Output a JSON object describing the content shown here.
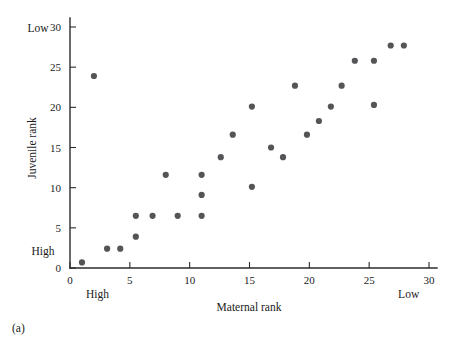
{
  "figure": {
    "caption": "(a)"
  },
  "chart_data": {
    "type": "scatter",
    "title": "",
    "xlabel": "Maternal rank",
    "ylabel": "Juvenile rank",
    "xlim": [
      0,
      31
    ],
    "ylim": [
      0,
      31
    ],
    "xticks": [
      0,
      5,
      10,
      15,
      20,
      25,
      30
    ],
    "xtick_labels": [
      "0",
      "5",
      "10",
      "15",
      "20",
      "25",
      "30"
    ],
    "yticks": [
      0,
      5,
      10,
      15,
      20,
      25,
      30
    ],
    "ytick_labels": [
      "0",
      "5",
      "10",
      "15",
      "20",
      "25",
      "30"
    ],
    "grid": false,
    "legend": null,
    "axis_end_labels": {
      "x_low_end": "High",
      "x_high_end": "Low",
      "y_low_end": "High",
      "y_high_end": "Low"
    },
    "marker": {
      "shape": "circle",
      "color": "#555558",
      "size": 3.1
    },
    "points": [
      {
        "x": 1.0,
        "y": 0.7
      },
      {
        "x": 2.0,
        "y": 23.9
      },
      {
        "x": 3.1,
        "y": 2.4
      },
      {
        "x": 4.2,
        "y": 2.4
      },
      {
        "x": 5.5,
        "y": 6.5
      },
      {
        "x": 5.5,
        "y": 3.9
      },
      {
        "x": 6.9,
        "y": 6.5
      },
      {
        "x": 8.0,
        "y": 11.6
      },
      {
        "x": 9.0,
        "y": 6.5
      },
      {
        "x": 11.0,
        "y": 6.5
      },
      {
        "x": 11.0,
        "y": 9.1
      },
      {
        "x": 11.0,
        "y": 11.6
      },
      {
        "x": 12.6,
        "y": 13.8
      },
      {
        "x": 13.6,
        "y": 16.6
      },
      {
        "x": 15.2,
        "y": 20.1
      },
      {
        "x": 15.2,
        "y": 10.1
      },
      {
        "x": 16.8,
        "y": 15.0
      },
      {
        "x": 17.8,
        "y": 13.8
      },
      {
        "x": 18.8,
        "y": 22.7
      },
      {
        "x": 19.8,
        "y": 16.6
      },
      {
        "x": 20.8,
        "y": 18.3
      },
      {
        "x": 21.8,
        "y": 20.1
      },
      {
        "x": 22.7,
        "y": 22.7
      },
      {
        "x": 23.8,
        "y": 25.8
      },
      {
        "x": 25.4,
        "y": 20.3
      },
      {
        "x": 25.4,
        "y": 25.8
      },
      {
        "x": 26.8,
        "y": 27.7
      },
      {
        "x": 27.9,
        "y": 27.7
      }
    ]
  }
}
